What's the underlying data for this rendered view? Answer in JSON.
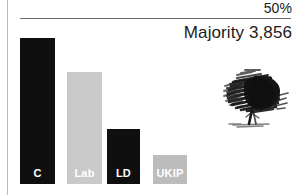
{
  "chart_data": {
    "type": "bar",
    "title": "",
    "subtitle": "",
    "xlabel": "",
    "ylabel": "",
    "categories": [
      "C",
      "Lab",
      "LD",
      "UKIP"
    ],
    "values": [
      43.0,
      27.0,
      10.6,
      6.0
    ],
    "ylim": [
      0,
      50
    ],
    "grid": true,
    "gridlines": [
      {
        "value": 50,
        "label": "50%"
      }
    ],
    "legend": "none",
    "annotations": [
      {
        "text": "Majority 3,856",
        "position": "top-right"
      }
    ],
    "series": [
      {
        "name": "vote share",
        "values": [
          43.0,
          27.0,
          10.6,
          6.0
        ],
        "colors": [
          "#0f0f0f",
          "#c9c9c9",
          "#0f0f0f",
          "#bcbcbc"
        ],
        "label_colors": [
          "#ffffff",
          "#ffffff",
          "#ffffff",
          "#ffffff"
        ]
      }
    ]
  },
  "axis": {
    "gridline_50_label": "50%"
  },
  "annotation": {
    "majority_text": "Majority 3,856"
  },
  "bars": [
    {
      "label": "C",
      "color": "#0f0f0f",
      "left": 20,
      "width": 35,
      "top": 38,
      "bottom": 184
    },
    {
      "label": "Lab",
      "color": "#c9c9c9",
      "left": 67,
      "width": 35,
      "top": 72,
      "bottom": 184
    },
    {
      "label": "LD",
      "color": "#0f0f0f",
      "left": 107,
      "width": 33,
      "top": 129,
      "bottom": 184
    },
    {
      "label": "UKIP",
      "color": "#bcbcbc",
      "left": 153,
      "width": 34,
      "top": 155,
      "bottom": 184
    }
  ],
  "illustration": {
    "name": "oak-tree-sketch",
    "color": "#1a1a1a"
  },
  "colors": {
    "background": "#ffffff",
    "bar_dark": "#0f0f0f",
    "bar_light_gray": "#c9c9c9",
    "bar_mid_gray": "#bcbcbc",
    "gridline": "#6e6e6e",
    "axis_line": "#b9b9b9",
    "text": "#1b1b1b"
  }
}
